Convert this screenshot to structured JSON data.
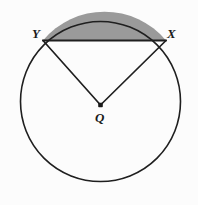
{
  "diagram": {
    "type": "geometry-circle-segment",
    "canvas": {
      "width": 198,
      "height": 205,
      "background": "#fcfcfc"
    },
    "circle": {
      "name": "circle-Q",
      "center": {
        "x": 100.5,
        "y": 101.5
      },
      "radius": 80,
      "stroke": "#1f1f1f",
      "stroke_width": 1.6,
      "fill": "none"
    },
    "center_point": {
      "name": "center-dot",
      "x": 100.5,
      "y": 105,
      "size": 4.6,
      "color": "#1a1a1a"
    },
    "points": [
      {
        "id": "Y",
        "label": "Y",
        "x": 43,
        "y": 40.5,
        "label_x": 32,
        "label_y": 27
      },
      {
        "id": "X",
        "label": "X",
        "x": 166,
        "y": 40.5,
        "label_x": 167,
        "label_y": 27
      },
      {
        "id": "Q",
        "label": "Q",
        "x": 100.5,
        "y": 105,
        "label_x": 95,
        "label_y": 111
      }
    ],
    "chord": {
      "name": "chord-XY",
      "from": "Y",
      "to": "X",
      "x1": 43,
      "y1": 40.5,
      "x2": 166,
      "y2": 40.5,
      "stroke": "#1f1f1f",
      "stroke_width": 2.0
    },
    "radii": [
      {
        "name": "radius-QY",
        "from": "Q",
        "to": "Y",
        "x1": 100.5,
        "y1": 105,
        "x2": 43,
        "y2": 40.5,
        "stroke": "#1f1f1f",
        "stroke_width": 1.7
      },
      {
        "name": "radius-QX",
        "from": "Q",
        "to": "X",
        "x1": 100.5,
        "y1": 105,
        "x2": 166,
        "y2": 40.5,
        "stroke": "#1f1f1f",
        "stroke_width": 1.7
      }
    ],
    "shaded_segment": {
      "name": "shaded-minor-segment",
      "description": "Minor circular segment bounded by chord XY and the minor arc XY",
      "fill": "#9a9a9a",
      "path": "M 43 40.5 A 80 80 0 0 1 166 40.5 Z"
    },
    "labels": {
      "Y": "Y",
      "X": "X",
      "Q": "Q"
    },
    "colors": {
      "stroke": "#1f1f1f",
      "segment_fill": "#9a9a9a",
      "background": "#fcfcfc",
      "label_color": "#1a1a1a"
    }
  }
}
